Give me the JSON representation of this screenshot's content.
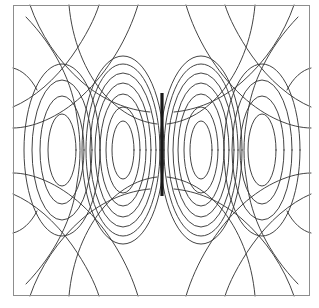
{
  "figure": {
    "title": "",
    "background_color": "#ffffff",
    "border_color": "#8d8d8d",
    "contour_color": "#3a3a3a",
    "dipole_color": "#1a1a1a",
    "plot_area": {
      "x": 13,
      "y": 5,
      "width": 297,
      "height": 291
    }
  },
  "chart_data": {
    "type": "contour",
    "title": "",
    "subtitle": "",
    "xlabel": "",
    "ylabel": "",
    "xlim": [
      -3,
      3
    ],
    "ylim": [
      -3,
      3
    ],
    "grid": false,
    "legend": null,
    "axes_visible": false,
    "tick_labels_x": [],
    "tick_labels_y": [],
    "annotations": [
      {
        "name": "dipole-conductor",
        "type": "thick-vertical-segment",
        "x": 162,
        "y_top": 93,
        "y_bottom": 196,
        "thickness_px": 3.2,
        "color": "#1a1a1a"
      }
    ],
    "symmetry": {
      "vertical_axis_x": 162,
      "horizontal_axis_y": 150.5
    },
    "contour_levels": [
      1,
      2,
      3,
      4,
      5,
      6,
      7,
      8,
      9,
      10,
      11,
      12
    ],
    "lobe_groups": [
      {
        "name": "inner-lobe-right",
        "center_x": 200,
        "center_y": 150,
        "nested_count": 7,
        "max_rx": 40,
        "max_ry": 95
      },
      {
        "name": "inner-lobe-left",
        "center_x": 124,
        "center_y": 150,
        "nested_count": 7,
        "max_rx": 40,
        "max_ry": 95
      },
      {
        "name": "middle-lobe-right",
        "center_x": 262,
        "center_y": 150,
        "nested_count": 5,
        "max_rx": 47,
        "max_ry": 108
      },
      {
        "name": "middle-lobe-left",
        "center_x": 62,
        "center_y": 150,
        "nested_count": 5,
        "max_rx": 47,
        "max_ry": 108
      },
      {
        "name": "outer-swept-lobes",
        "count": 4,
        "orientation": "diagonal-swept-toward-corners",
        "nested_count": 2
      }
    ]
  }
}
